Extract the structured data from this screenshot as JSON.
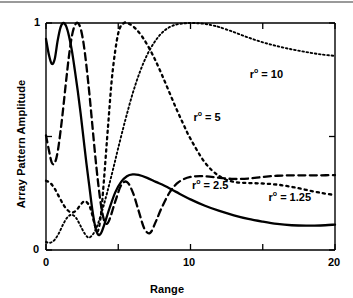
{
  "chart_data": {
    "type": "line",
    "title": "",
    "xlabel": "Range",
    "ylabel": "Array Pattern Amplitude",
    "xlim": [
      0,
      20
    ],
    "ylim": [
      0,
      1
    ],
    "xticks": [
      0,
      5,
      10,
      15,
      20
    ],
    "xtick_labels": [
      "0",
      "",
      "10",
      "",
      "20"
    ],
    "yticks": [
      0,
      0.5,
      1
    ],
    "ytick_labels": [
      "0",
      "",
      "1"
    ],
    "grid": false,
    "legend_position": "inline-annotations",
    "series": [
      {
        "name": "r° = 1.25",
        "label": "r",
        "superscript": "o",
        "equals": "= 1.25",
        "style": "solid",
        "color": "#000000",
        "annotation_x": 15.4,
        "annotation_y": 0.235,
        "x": [
          0,
          0.2,
          0.4,
          0.6,
          0.8,
          1.0,
          1.2,
          1.4,
          1.6,
          1.8,
          2.0,
          2.2,
          2.4,
          2.6,
          2.8,
          3.0,
          3.2,
          3.4,
          3.6,
          3.8,
          4.0,
          4.4,
          4.8,
          5.2,
          5.6,
          6.0,
          6.4,
          7.0,
          7.6,
          8.2,
          9.0,
          10.0,
          11.0,
          12.0,
          13.0,
          14.0,
          15.0,
          16.0,
          17.0,
          18.0,
          19.0,
          20.0
        ],
        "y": [
          0.93,
          0.86,
          0.82,
          0.84,
          0.92,
          0.98,
          1.0,
          0.985,
          0.94,
          0.875,
          0.79,
          0.7,
          0.6,
          0.49,
          0.38,
          0.28,
          0.18,
          0.105,
          0.068,
          0.073,
          0.105,
          0.185,
          0.255,
          0.3,
          0.325,
          0.333,
          0.331,
          0.318,
          0.3,
          0.283,
          0.256,
          0.223,
          0.195,
          0.172,
          0.153,
          0.137,
          0.125,
          0.115,
          0.109,
          0.107,
          0.108,
          0.112
        ]
      },
      {
        "name": "r° = 2.5",
        "label": "r",
        "superscript": "o",
        "equals": "= 2.5",
        "style": "dashed",
        "color": "#000000",
        "annotation_x": 10.1,
        "annotation_y": 0.285,
        "x": [
          0,
          0.2,
          0.4,
          0.6,
          0.8,
          1.0,
          1.2,
          1.4,
          1.6,
          1.8,
          2.0,
          2.2,
          2.4,
          2.6,
          2.8,
          3.0,
          3.2,
          3.4,
          3.6,
          3.8,
          4.0,
          4.2,
          4.4,
          4.8,
          5.2,
          5.6,
          6.0,
          6.4,
          6.8,
          7.2,
          7.6,
          8.0,
          8.6,
          9.2,
          10.0,
          11.0,
          12.0,
          13.0,
          14.0,
          15.0,
          16.0,
          17.0,
          18.0,
          19.0,
          20.0
        ],
        "y": [
          0.505,
          0.44,
          0.385,
          0.383,
          0.43,
          0.52,
          0.63,
          0.75,
          0.86,
          0.945,
          0.99,
          1.0,
          0.975,
          0.91,
          0.81,
          0.69,
          0.555,
          0.42,
          0.3,
          0.2,
          0.135,
          0.115,
          0.135,
          0.215,
          0.285,
          0.3,
          0.255,
          0.175,
          0.095,
          0.075,
          0.125,
          0.185,
          0.258,
          0.3,
          0.322,
          0.325,
          0.318,
          0.313,
          0.315,
          0.322,
          0.327,
          0.329,
          0.329,
          0.329,
          0.33
        ]
      },
      {
        "name": "r° = 5",
        "label": "r",
        "superscript": "o",
        "equals": "= 5",
        "style": "dotted-medium",
        "color": "#000000",
        "annotation_x": 10.2,
        "annotation_y": 0.585,
        "x": [
          0,
          0.3,
          0.6,
          0.9,
          1.2,
          1.5,
          1.8,
          2.1,
          2.4,
          2.7,
          3.0,
          3.2,
          3.4,
          3.6,
          3.8,
          4.0,
          4.3,
          4.6,
          5.0,
          5.4,
          5.8,
          6.2,
          6.6,
          7.0,
          7.5,
          8.0,
          8.5,
          9.0,
          9.5,
          10.0,
          11.0,
          12.0,
          13.0,
          14.0,
          15.0,
          16.0,
          17.0,
          18.0,
          19.0,
          20.0
        ],
        "y": [
          0.305,
          0.295,
          0.27,
          0.235,
          0.2,
          0.175,
          0.165,
          0.175,
          0.2,
          0.215,
          0.195,
          0.155,
          0.105,
          0.085,
          0.155,
          0.3,
          0.55,
          0.78,
          0.955,
          1.0,
          0.995,
          0.975,
          0.945,
          0.905,
          0.845,
          0.775,
          0.7,
          0.625,
          0.555,
          0.49,
          0.385,
          0.325,
          0.3,
          0.295,
          0.293,
          0.288,
          0.278,
          0.265,
          0.252,
          0.242
        ]
      },
      {
        "name": "r° = 10",
        "label": "r",
        "superscript": "o",
        "equals": "= 10",
        "style": "dotted-fine",
        "color": "#000000",
        "annotation_x": 14.1,
        "annotation_y": 0.775,
        "x": [
          0,
          0.3,
          0.6,
          0.9,
          1.2,
          1.5,
          1.8,
          2.1,
          2.4,
          2.7,
          3.0,
          3.4,
          3.8,
          4.2,
          4.6,
          5.0,
          5.5,
          6.0,
          6.5,
          7.0,
          7.5,
          8.0,
          8.5,
          9.0,
          9.5,
          10.0,
          10.5,
          11.0,
          11.5,
          12.0,
          13.0,
          14.0,
          15.0,
          16.0,
          17.0,
          18.0,
          19.0,
          20.0
        ],
        "y": [
          0.035,
          0.032,
          0.045,
          0.075,
          0.115,
          0.145,
          0.155,
          0.14,
          0.105,
          0.07,
          0.055,
          0.085,
          0.155,
          0.245,
          0.345,
          0.45,
          0.575,
          0.69,
          0.785,
          0.86,
          0.915,
          0.955,
          0.98,
          0.993,
          0.998,
          1.0,
          0.999,
          0.996,
          0.99,
          0.982,
          0.96,
          0.936,
          0.915,
          0.898,
          0.884,
          0.872,
          0.862,
          0.855
        ]
      }
    ]
  },
  "axes": {
    "ylabel": "Array Pattern Amplitude",
    "xlabel": "Range",
    "xtick_0": "0",
    "xtick_10": "10",
    "xtick_20": "20",
    "ytick_0": "0",
    "ytick_1": "1"
  },
  "annotations": {
    "r10": {
      "sym": "r",
      "sup": "o",
      "val": "= 10"
    },
    "r5": {
      "sym": "r",
      "sup": "o",
      "val": "= 5"
    },
    "r25": {
      "sym": "r",
      "sup": "o",
      "val": "= 2.5"
    },
    "r125": {
      "sym": "r",
      "sup": "o",
      "val": "= 1.25"
    }
  },
  "colors": {
    "ink": "#000000",
    "rule": "#9a9a9a",
    "background": "#ffffff"
  }
}
